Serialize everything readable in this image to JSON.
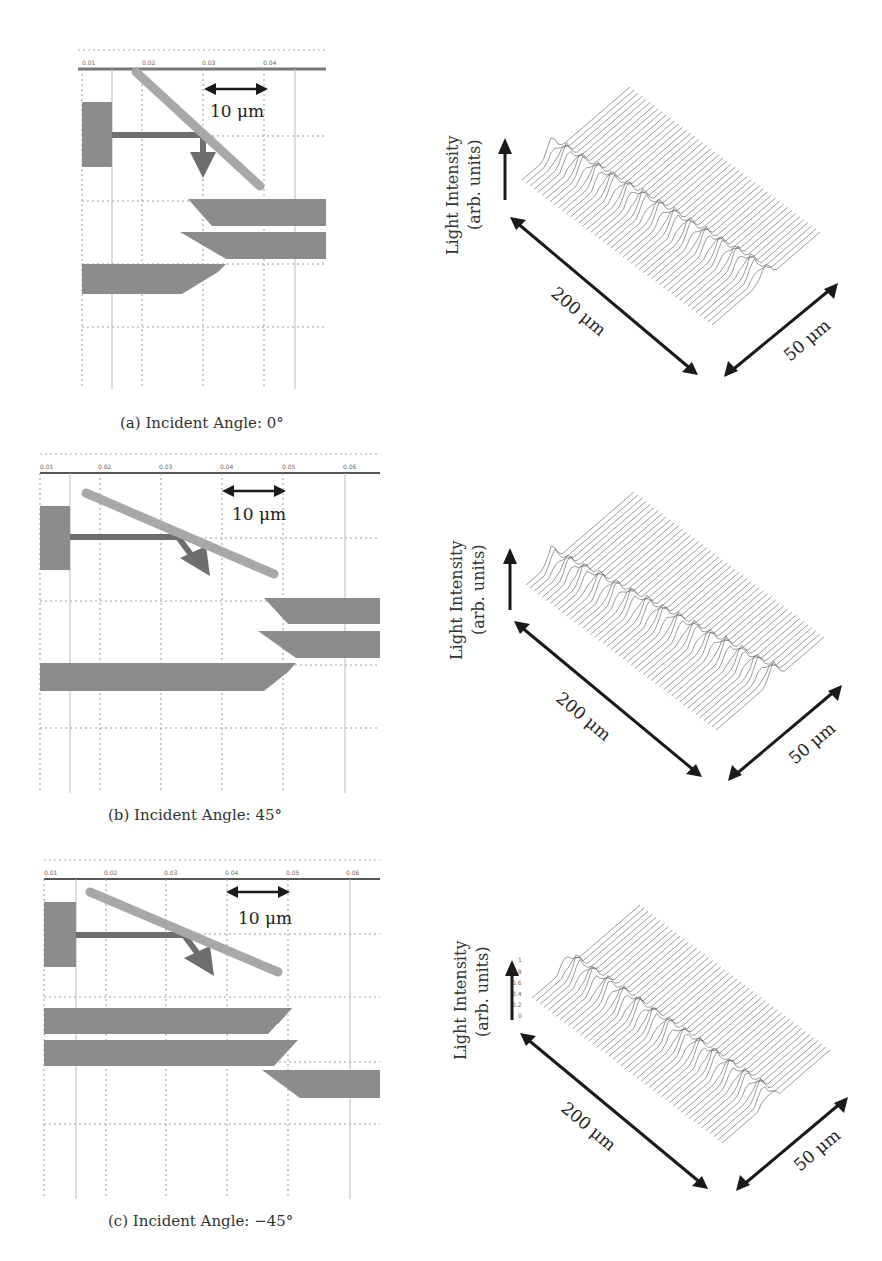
{
  "figure": {
    "panels": [
      {
        "id": "a",
        "caption": "(a) Incident Angle: 0°",
        "layout": {
          "ruler_ticks": [
            "0.01",
            "0.02",
            "0.03",
            "0.04"
          ],
          "scale_bar_label": "10 μm"
        },
        "plot": {
          "y_axis_title_line1": "Light Intensity",
          "y_axis_title_line2": "(arb. units)",
          "long_dim_label": "200 μm",
          "short_dim_label": "50 μm",
          "long_axis_ticks": [
            "0",
            "50",
            "100",
            "150",
            "200"
          ],
          "short_axis_ticks": [
            "0",
            "10",
            "20",
            "30",
            "40",
            "50"
          ]
        }
      },
      {
        "id": "b",
        "caption": "(b) Incident Angle: 45°",
        "layout": {
          "ruler_ticks": [
            "0.01",
            "0.02",
            "0.03",
            "0.04",
            "0.05",
            "0.06"
          ],
          "scale_bar_label": "10 μm"
        },
        "plot": {
          "y_axis_title_line1": "Light Intensity",
          "y_axis_title_line2": "(arb. units)",
          "long_dim_label": "200 μm",
          "short_dim_label": "50 μm",
          "long_axis_ticks": [
            "0",
            "50",
            "100",
            "150",
            "200"
          ],
          "short_axis_ticks": [
            "0",
            "10",
            "20",
            "30",
            "40",
            "50"
          ]
        }
      },
      {
        "id": "c",
        "caption": "(c) Incident Angle: −45°",
        "layout": {
          "ruler_ticks": [
            "0.01",
            "0.02",
            "0.03",
            "0.04",
            "0.05",
            "0.06"
          ],
          "scale_bar_label": "10 μm"
        },
        "plot": {
          "y_axis_title_line1": "Light Intensity",
          "y_axis_title_line2": "(arb. units)",
          "long_dim_label": "200 μm",
          "short_dim_label": "50 μm",
          "long_axis_ticks": [
            "0",
            "50",
            "100",
            "150",
            "200"
          ],
          "short_axis_ticks": [
            "0",
            "10",
            "20",
            "30",
            "40",
            "50"
          ],
          "z_axis_ticks": [
            "0",
            "0.2",
            "0.4",
            "0.6",
            "0.8",
            "1"
          ]
        }
      }
    ]
  },
  "colors": {
    "waveguide": "#8c8c8c",
    "mirror": "#a8a8a8",
    "beam": "#6a6a6a",
    "grid": "#9a9a9a",
    "ink": "#1a1a1a"
  }
}
